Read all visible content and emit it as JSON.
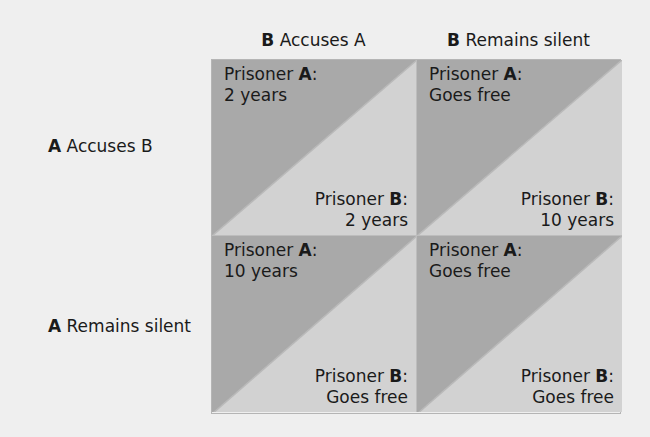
{
  "columns": [
    {
      "bold": "B",
      "label": " Accuses A"
    },
    {
      "bold": "B",
      "label": " Remains silent"
    }
  ],
  "rows": [
    {
      "bold": "A",
      "label": " Accuses B"
    },
    {
      "bold": "A",
      "label": " Remains silent"
    }
  ],
  "cells": [
    {
      "a_prefix": "Prisoner ",
      "a_bold": "A",
      "a_value": "2 years",
      "b_prefix": "Prisoner ",
      "b_bold": "B",
      "b_value": "2 years"
    },
    {
      "a_prefix": "Prisoner ",
      "a_bold": "A",
      "a_value": "Goes free",
      "b_prefix": "Prisoner ",
      "b_bold": "B",
      "b_value": "10 years"
    },
    {
      "a_prefix": "Prisoner ",
      "a_bold": "A",
      "a_value": "10 years",
      "b_prefix": "Prisoner ",
      "b_bold": "B",
      "b_value": "Goes free"
    },
    {
      "a_prefix": "Prisoner ",
      "a_bold": "A",
      "a_value": "Goes free",
      "b_prefix": "Prisoner ",
      "b_bold": "B",
      "b_value": "Goes free"
    }
  ],
  "colors": {
    "background": "#efefef",
    "dark_triangle": "#a9a9a9",
    "light_triangle": "#d2d2d2",
    "divider": "#b5b5b5"
  }
}
